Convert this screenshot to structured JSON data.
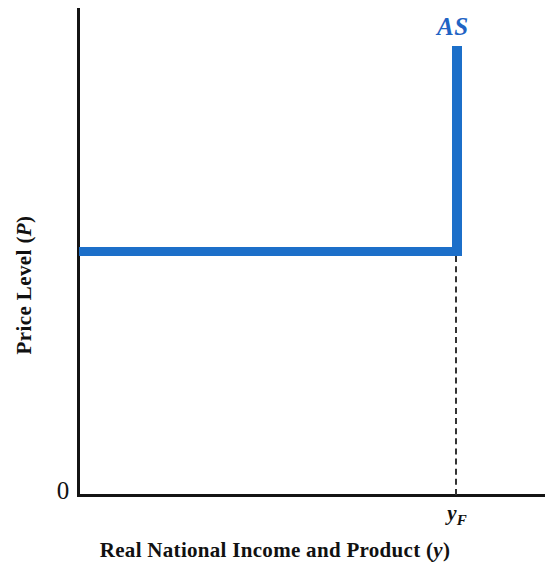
{
  "chart_data": {
    "type": "line",
    "title": "",
    "subtitle": "",
    "xlabel": "Real National Income and Product (y)",
    "xlabel_main": "Real National Income and Product (",
    "xlabel_var": "y",
    "xlabel_close": ")",
    "ylabel": "Price Level (P)",
    "ylabel_main": "Price Level (",
    "ylabel_var": "P",
    "ylabel_close": ")",
    "origin_label": "0",
    "grid": false,
    "legend_position": "inline-at-curve-end",
    "xlim": [
      0,
      1
    ],
    "ylim": [
      0,
      1
    ],
    "x_ticks": [
      {
        "label": "y_F",
        "var": "y",
        "sub": "F",
        "value": 0.805,
        "description": "full-employment level of real national income"
      }
    ],
    "y_ticks": [],
    "annotations": [
      {
        "text": "AS",
        "color": "#1f64c4",
        "style": "bold-italic",
        "x": 0.77,
        "y": 0.965,
        "description": "aggregate supply curve label"
      }
    ],
    "series": [
      {
        "name": "AS",
        "label": "AS",
        "color": "#1c6fc9",
        "line_width": 9,
        "shape": "reverse-L (horizontal then vertical at y_F)",
        "description": "Keynesian aggregate supply curve: horizontal (perfectly elastic) price level up to full-employment output y_F, then vertical (perfectly inelastic) at y_F",
        "points": [
          {
            "x": 0.0,
            "y": 0.506
          },
          {
            "x": 0.805,
            "y": 0.506
          },
          {
            "x": 0.805,
            "y": 0.925
          }
        ]
      }
    ],
    "reference_lines": [
      {
        "name": "y_F drop line",
        "orientation": "vertical",
        "x": 0.805,
        "y_from": 0.0,
        "y_to": 0.506,
        "style": "dashed",
        "color": "#333333"
      }
    ]
  },
  "figure": {
    "axis_color": "#141414",
    "curve_color": "#1c6fc9",
    "label_color": "#1f64c4",
    "background": "#ffffff"
  }
}
